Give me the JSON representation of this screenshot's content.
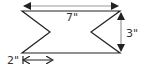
{
  "diagram": {
    "type": "geometry-figure",
    "shape": "rectangle with two triangular notches (left and right)",
    "colors": {
      "outline": "#222222",
      "dimension_arrow": "#9a9a9a",
      "dimension_arrow_dark": "#222222",
      "label": "#333333"
    },
    "dimensions": {
      "width": {
        "label": "7\"",
        "value": 7,
        "unit": "in"
      },
      "height": {
        "label": "3\"",
        "value": 3,
        "unit": "in"
      },
      "notch_depth": {
        "label": "2\"",
        "value": 2,
        "unit": "in"
      }
    }
  }
}
